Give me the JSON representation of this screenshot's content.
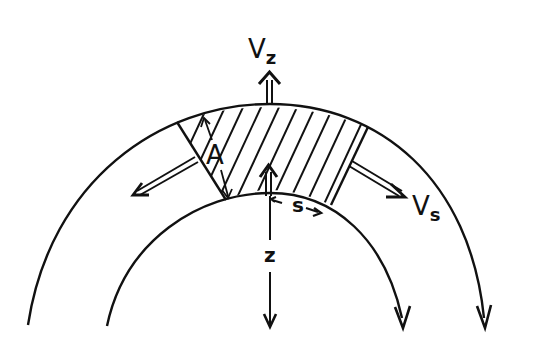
{
  "diagram": {
    "stroke_color": "#111111",
    "background": "#ffffff",
    "labels": {
      "vz_main": "V",
      "vz_sub": "z",
      "vs_main": "V",
      "vs_sub": "s",
      "a": "A",
      "s": "s",
      "z": "z"
    },
    "elements": [
      {
        "name": "outer-arc",
        "role": "outer boundary of curved layer"
      },
      {
        "name": "inner-arc",
        "role": "inner boundary of curved layer"
      },
      {
        "name": "hatched-element",
        "role": "control volume of cross-section A"
      },
      {
        "name": "vz-arrow",
        "role": "vertical velocity V_z (upward)"
      },
      {
        "name": "vs-arrow-right",
        "role": "along-slope velocity V_s (outflow right)"
      },
      {
        "name": "vs-arrow-left",
        "role": "along-slope velocity (outflow left)"
      },
      {
        "name": "z-axis-arrow",
        "role": "z coordinate pointing down"
      },
      {
        "name": "s-axis-arrow",
        "role": "s coordinate along inner arc"
      },
      {
        "name": "a-dimension",
        "role": "thickness A of the element"
      }
    ]
  }
}
